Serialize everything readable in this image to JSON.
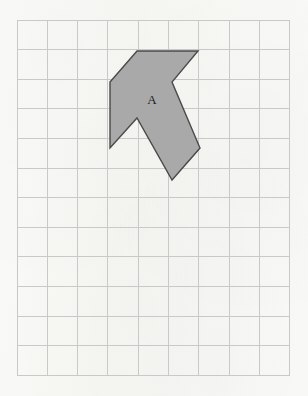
{
  "page": {
    "width": 308,
    "height": 396,
    "background_color": "#f7f7f5"
  },
  "grid": {
    "columns": 9,
    "rows": 12,
    "origin_x": 17,
    "origin_y": 20,
    "cell_width": 30.3,
    "cell_height": 29.6,
    "line_color": "#c9c9c9",
    "faint_line_color": "#dedede",
    "show_grid": true,
    "x_lines": [
      17,
      47.3,
      77.6,
      107.9,
      138.2,
      168.5,
      198.8,
      229.1,
      259.4,
      289.7
    ],
    "y_lines": [
      20,
      49.6,
      79.2,
      108.8,
      138.4,
      168,
      197.6,
      227.2,
      256.8,
      286.4,
      316,
      345.6,
      375.2
    ]
  },
  "shapes": [
    {
      "id": "shape-a",
      "label": "A",
      "label_x": 152,
      "label_y": 101,
      "fill_color": "#a9a9a9",
      "stroke_color": "#4a4a4a",
      "points": "137,51 198,51 172,82 200,148 172,180 137,118 110,148 110,82",
      "vertices": [
        [
          137,
          51
        ],
        [
          198,
          51
        ],
        [
          172,
          82
        ],
        [
          200,
          148
        ],
        [
          172,
          180
        ],
        [
          137,
          118
        ],
        [
          110,
          148
        ],
        [
          110,
          82
        ]
      ]
    }
  ]
}
